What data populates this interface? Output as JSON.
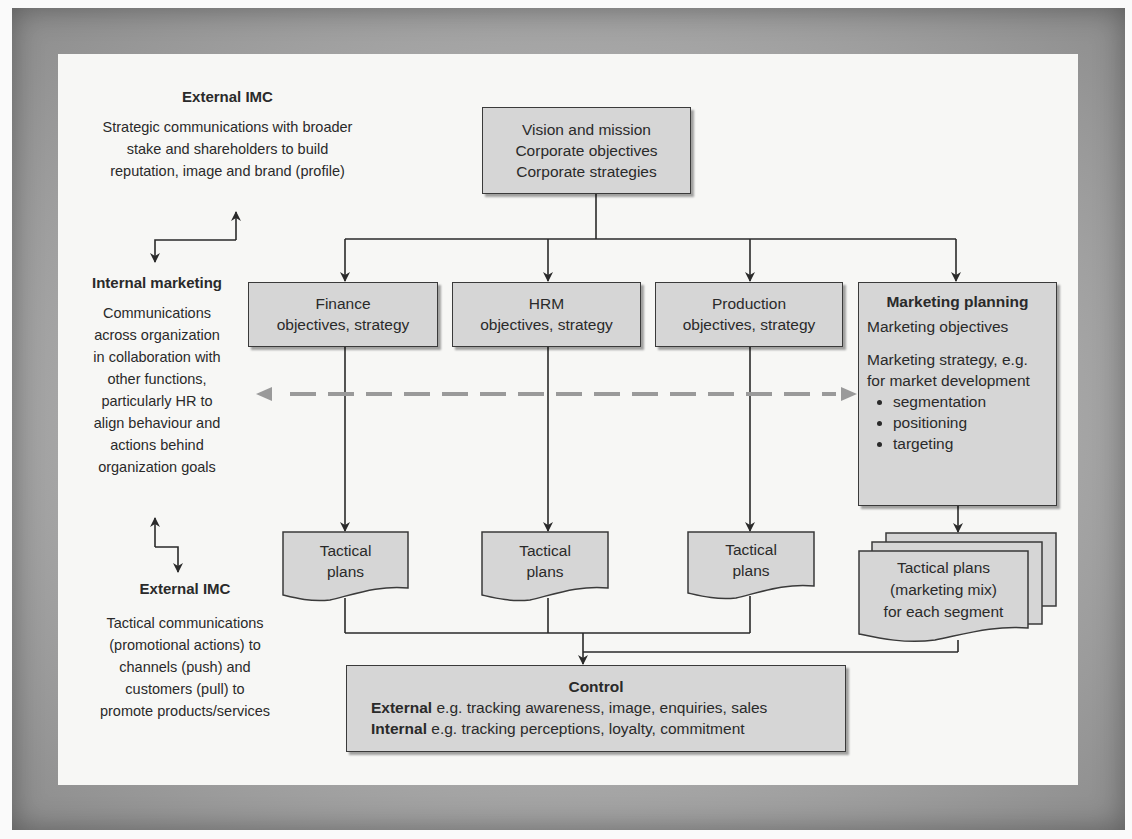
{
  "diagram": {
    "corporate_box": {
      "lines": [
        "Vision and mission",
        "Corporate objectives",
        "Corporate strategies"
      ]
    },
    "functional_boxes": [
      {
        "title": "Finance",
        "subtitle": "objectives, strategy"
      },
      {
        "title": "HRM",
        "subtitle": "objectives, strategy"
      },
      {
        "title": "Production",
        "subtitle": "objectives, strategy"
      }
    ],
    "marketing_planning": {
      "title": "Marketing planning",
      "objectives": "Marketing objectives",
      "strategy_line1": "Marketing strategy, e.g.",
      "strategy_line2": "for market development",
      "bullets": [
        "segmentation",
        "positioning",
        "targeting"
      ]
    },
    "tactical_plans": [
      {
        "line1": "Tactical",
        "line2": "plans"
      },
      {
        "line1": "Tactical",
        "line2": "plans"
      },
      {
        "line1": "Tactical",
        "line2": "plans"
      }
    ],
    "marketing_tactical": {
      "line1": "Tactical plans",
      "line2": "(marketing mix)",
      "line3": "for each segment"
    },
    "control": {
      "title": "Control",
      "external_label": "External",
      "external_text": " e.g. tracking awareness, image, enquiries, sales",
      "internal_label": "Internal",
      "internal_text": " e.g. tracking perceptions, loyalty, commitment"
    },
    "side_notes": {
      "external_imc_top": {
        "heading": "External IMC",
        "lines": [
          "Strategic communications with broader",
          "stake and shareholders to build",
          "reputation, image and brand (profile)"
        ]
      },
      "internal_marketing": {
        "heading": "Internal marketing",
        "lines": [
          "Communications",
          "across organization",
          "in collaboration with",
          "other functions,",
          "particularly HR to",
          "align behaviour and",
          "actions behind",
          "organization goals"
        ]
      },
      "external_imc_bottom": {
        "heading": "External IMC",
        "lines": [
          "Tactical communications",
          "(promotional actions) to",
          "channels (push) and",
          "customers (pull) to",
          "promote products/services"
        ]
      }
    },
    "colors": {
      "box_fill": "#d6d6d6",
      "line": "#2a2a2a",
      "dashed_arrow": "#9a9a9a",
      "frame": "#a8a8a8",
      "panel": "#f7f7f5"
    }
  }
}
